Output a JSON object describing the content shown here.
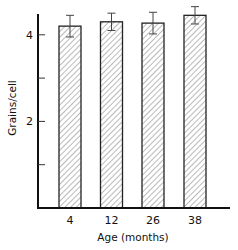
{
  "chart_data": {
    "type": "bar",
    "title": "",
    "xlabel": "Age (months)",
    "ylabel": "Grains/cell",
    "categories": [
      "4",
      "12",
      "26",
      "38"
    ],
    "values": [
      4.2,
      4.3,
      4.27,
      4.45
    ],
    "errors": [
      0.25,
      0.2,
      0.25,
      0.2
    ],
    "ylim": [
      0,
      4.5
    ],
    "yticks": [
      {
        "value": 4,
        "label": "4"
      },
      {
        "value": 3,
        "label": ""
      },
      {
        "value": 2,
        "label": "2"
      },
      {
        "value": 1,
        "label": ""
      }
    ],
    "grid": false,
    "legend": null,
    "bar_fill": "diagonal-hatch",
    "colors": {
      "axis": "#111111",
      "bar_stroke": "#222222",
      "hatch": "#555555",
      "background": "#ffffff"
    }
  }
}
